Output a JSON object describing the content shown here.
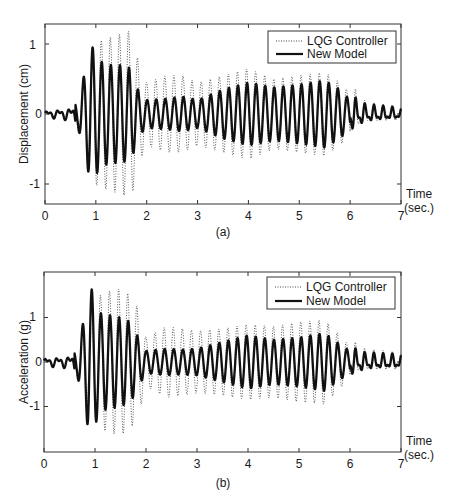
{
  "chart_data": [
    {
      "id": "a",
      "type": "line",
      "caption": "(a)",
      "ylabel": "Displacement (cm)",
      "xlabel_line1": "Time",
      "xlabel_line2": "(sec.)",
      "xlim": [
        0,
        7
      ],
      "ylim": [
        -1.3,
        1.3
      ],
      "xticks": [
        "0",
        "1",
        "2",
        "3",
        "4",
        "5",
        "6",
        "7"
      ],
      "yticks": [
        {
          "value": 1,
          "label": "1"
        },
        {
          "value": 0,
          "label": "0"
        },
        {
          "value": -1,
          "label": "-1"
        }
      ],
      "grid": false,
      "legend": {
        "position": "upper right",
        "entries": [
          "LQG Controller",
          "New Model"
        ]
      },
      "frequency_hz": 5.6,
      "series": [
        {
          "name": "LQG Controller",
          "style": "dotted",
          "envelope_t": [
            0,
            0.5,
            0.7,
            0.8,
            0.95,
            1.1,
            1.3,
            1.5,
            1.7,
            1.85,
            2.0,
            2.4,
            2.7,
            3.0,
            3.5,
            4.0,
            4.5,
            5.0,
            5.5,
            5.8,
            6.0,
            6.3,
            7.0
          ],
          "envelope_amp": [
            0.05,
            0.1,
            0.3,
            0.65,
            1.0,
            1.05,
            1.1,
            1.15,
            1.2,
            0.7,
            0.45,
            0.55,
            0.55,
            0.45,
            0.55,
            0.65,
            0.5,
            0.55,
            0.6,
            0.45,
            0.3,
            0.12,
            0.08
          ]
        },
        {
          "name": "New Model",
          "style": "solid",
          "envelope_t": [
            0,
            0.5,
            0.65,
            0.8,
            0.9,
            1.1,
            1.3,
            1.5,
            1.7,
            1.85,
            2.0,
            2.4,
            2.7,
            3.0,
            3.5,
            4.0,
            4.5,
            5.0,
            5.5,
            5.8,
            6.0,
            6.3,
            7.0
          ],
          "envelope_amp": [
            0.05,
            0.1,
            0.2,
            0.65,
            1.0,
            0.75,
            0.7,
            0.7,
            0.65,
            0.3,
            0.2,
            0.22,
            0.25,
            0.2,
            0.35,
            0.45,
            0.38,
            0.42,
            0.48,
            0.35,
            0.2,
            0.1,
            0.06
          ]
        }
      ]
    },
    {
      "id": "b",
      "type": "line",
      "caption": "(b)",
      "ylabel": "Acceleration (g)",
      "xlabel_line1": "Time",
      "xlabel_line2": "(sec.)",
      "xlim": [
        0,
        7
      ],
      "ylim": [
        -2.0,
        2.0
      ],
      "xticks": [
        "0",
        "1",
        "2",
        "3",
        "4",
        "5",
        "6",
        "7"
      ],
      "yticks": [
        {
          "value": 1,
          "label": "1"
        },
        {
          "value": 0,
          "label": "0"
        },
        {
          "value": -1,
          "label": "-1"
        }
      ],
      "grid": false,
      "legend": {
        "position": "upper right",
        "entries": [
          "LQG Controller",
          "New Model"
        ]
      },
      "frequency_hz": 5.6,
      "series": [
        {
          "name": "LQG Controller",
          "style": "dotted",
          "envelope_t": [
            0,
            0.5,
            0.7,
            0.8,
            0.95,
            1.1,
            1.3,
            1.5,
            1.7,
            1.85,
            2.0,
            2.4,
            2.7,
            3.0,
            3.5,
            4.0,
            4.5,
            5.0,
            5.5,
            5.8,
            6.0,
            6.3,
            7.0
          ],
          "envelope_amp": [
            0.1,
            0.15,
            0.4,
            0.9,
            1.25,
            1.5,
            1.6,
            1.65,
            1.5,
            1.2,
            0.55,
            0.8,
            0.75,
            0.7,
            0.75,
            0.85,
            0.8,
            0.9,
            0.95,
            0.6,
            0.35,
            0.2,
            0.15
          ]
        },
        {
          "name": "New Model",
          "style": "solid",
          "envelope_t": [
            0,
            0.5,
            0.65,
            0.8,
            0.9,
            1.1,
            1.3,
            1.5,
            1.7,
            1.85,
            2.0,
            2.4,
            2.7,
            3.0,
            3.5,
            4.0,
            4.5,
            5.0,
            5.5,
            5.8,
            6.0,
            6.3,
            7.0
          ],
          "envelope_amp": [
            0.1,
            0.15,
            0.3,
            1.05,
            1.75,
            1.1,
            1.05,
            1.0,
            0.9,
            0.55,
            0.25,
            0.3,
            0.28,
            0.3,
            0.45,
            0.6,
            0.5,
            0.55,
            0.65,
            0.4,
            0.25,
            0.15,
            0.12
          ]
        }
      ]
    }
  ],
  "figures": {
    "a": {
      "caption": "(a)",
      "ylabel": "Displacement (cm)",
      "time_label": "Time",
      "time_unit": "(sec.)",
      "legend_lqg": "LQG Controller",
      "legend_new": "New Model",
      "ytick_pos1": "1",
      "ytick_zero": "0",
      "ytick_neg1": "-1"
    },
    "b": {
      "caption": "(b)",
      "ylabel": "Acceleration (g)",
      "time_label": "Time",
      "time_unit": "(sec.)",
      "legend_lqg": "LQG Controller",
      "legend_new": "New Model",
      "ytick_pos1": "1",
      "ytick_zero": "0",
      "ytick_neg1": "-1"
    }
  },
  "xticks": [
    "0",
    "1",
    "2",
    "3",
    "4",
    "5",
    "6",
    "7"
  ],
  "colors": {
    "line": "#111111",
    "axis": "#333333",
    "background": "#ffffff"
  }
}
